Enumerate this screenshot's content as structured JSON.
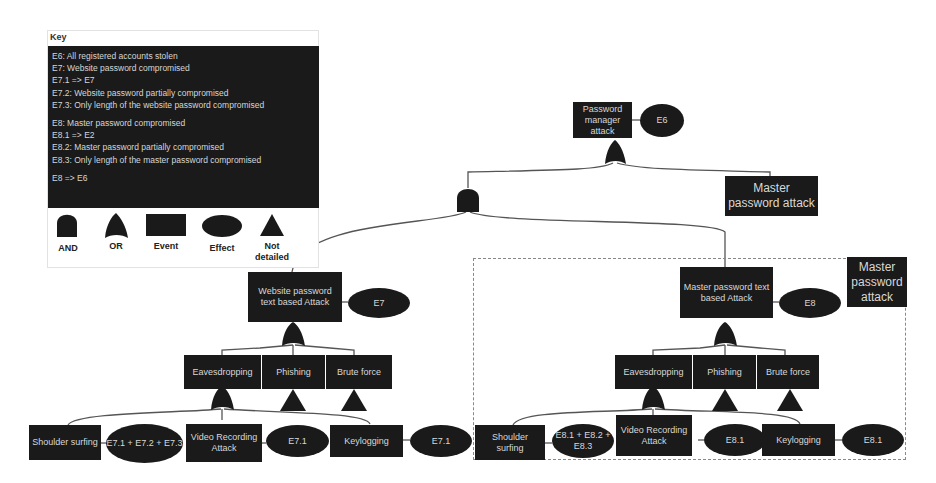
{
  "key": {
    "title": "Key",
    "lines": [
      "E6: All registered accounts stolen",
      "E7: Website password compromised",
      "E7.1 => E7",
      "E7.2: Website password partially compromised",
      "E7.3: Only length of the website password compromised",
      "E8: Master password compromised",
      "E8.1 => E2",
      "E8.2: Master password partially compromised",
      "E8.3: Only length of the master password compromised",
      "E8 => E6"
    ],
    "legend": [
      {
        "shape": "and-gate-icon",
        "label": "AND"
      },
      {
        "shape": "or-gate-icon",
        "label": "OR"
      },
      {
        "shape": "event-rectangle-icon",
        "label": "Event"
      },
      {
        "shape": "effect-ellipse-icon",
        "label": "Effect"
      },
      {
        "shape": "not-detailed-triangle-icon",
        "label": "Not detailed"
      }
    ]
  },
  "root": {
    "event": "Password manager attack",
    "effect": "E6"
  },
  "master_attack_ref": {
    "label": "Master password attack"
  },
  "website_branch": {
    "event": "Website password text based Attack",
    "effect": "E7",
    "children": [
      {
        "label": "Eavesdropping"
      },
      {
        "label": "Phishing"
      },
      {
        "label": "Brute force"
      }
    ],
    "leaves": [
      {
        "label": "Shoulder surfing",
        "effect": "E7.1 + E7.2 + E7.3"
      },
      {
        "label": "Video Recording Attack",
        "effect": "E7.1"
      },
      {
        "label": "Keylogging",
        "effect": "E7.1"
      }
    ]
  },
  "master_branch": {
    "group_label": "Master password attack",
    "event": "Master password text based Attack",
    "effect": "E8",
    "children": [
      {
        "label": "Eavesdropping"
      },
      {
        "label": "Phishing"
      },
      {
        "label": "Brute force"
      }
    ],
    "leaves": [
      {
        "label": "Shoulder surfing",
        "effect": "E8.1 + E8.2 + E8.3"
      },
      {
        "label": "Video Recording Attack",
        "effect": "E8.1"
      },
      {
        "label": "Keylogging",
        "effect": "E8.1"
      }
    ]
  },
  "colors": {
    "node_fill": "#1a1a1a",
    "node_text": "#d8d8d8",
    "wire": "#555555",
    "dashed_border": "#888888"
  }
}
